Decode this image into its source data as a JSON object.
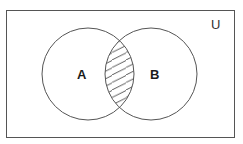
{
  "diagram": {
    "type": "venn",
    "universe": {
      "label": "U",
      "rect": {
        "x": 6.5,
        "y": 10.5,
        "width": 228,
        "height": 127
      }
    },
    "sets": [
      {
        "label": "A",
        "cx": 88,
        "cy": 74,
        "r": 46,
        "label_x": 82,
        "label_y": 79
      },
      {
        "label": "B",
        "cx": 151,
        "cy": 74,
        "r": 46,
        "label_x": 155,
        "label_y": 79
      }
    ],
    "shaded_region": "A ∩ B",
    "shading_style": "diagonal-hatch",
    "colors": {
      "stroke": "#555555",
      "hatch": "#444444",
      "background": "#ffffff",
      "text": "#1a1a1a"
    }
  }
}
